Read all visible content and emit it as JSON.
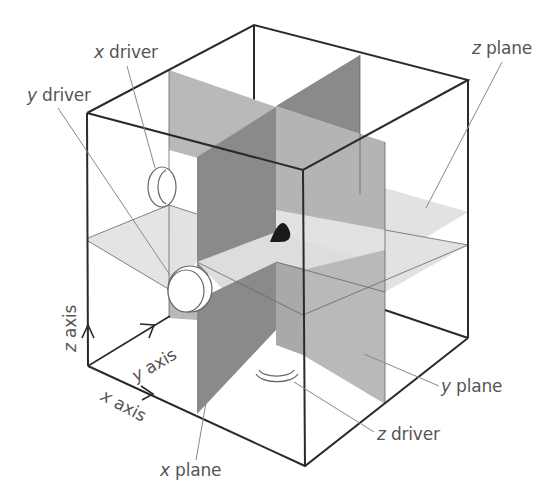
{
  "figure": {
    "colors": {
      "background": "#ffffff",
      "edge": "#2a2a2a",
      "leader_line": "#888888",
      "x_plane": "#8a8a8a",
      "y_plane": "#b9b9b9",
      "z_plane": "#e2e2e2",
      "intersection_point": "#1a1a1a",
      "driver_fill": "#ffffff",
      "label_text": "#555555"
    }
  },
  "labels": {
    "x_driver": {
      "var": "x",
      "text": " driver"
    },
    "y_driver": {
      "var": "y",
      "text": " driver"
    },
    "z_driver": {
      "var": "z",
      "text": " driver"
    },
    "x_plane": {
      "var": "x",
      "text": " plane"
    },
    "y_plane": {
      "var": "y",
      "text": " plane"
    },
    "z_plane": {
      "var": "z",
      "text": " plane"
    },
    "x_axis": {
      "var": "x",
      "text": " axis"
    },
    "y_axis": {
      "var": "y",
      "text": " axis"
    },
    "z_axis": {
      "var": "z",
      "text": " axis"
    }
  },
  "components": [
    {
      "id": "x-driver",
      "kind": "driver",
      "axis": "x"
    },
    {
      "id": "y-driver",
      "kind": "driver",
      "axis": "y"
    },
    {
      "id": "z-driver",
      "kind": "driver",
      "axis": "z"
    },
    {
      "id": "x-plane",
      "kind": "plane",
      "axis": "x"
    },
    {
      "id": "y-plane",
      "kind": "plane",
      "axis": "y"
    },
    {
      "id": "z-plane",
      "kind": "plane",
      "axis": "z"
    },
    {
      "id": "intersection-point",
      "kind": "point"
    }
  ]
}
